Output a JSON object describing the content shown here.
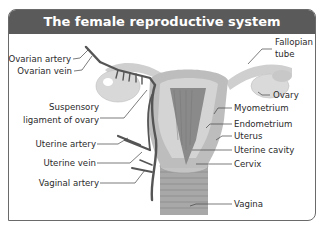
{
  "title": "The female reproductive system",
  "labels": {
    "left": {
      "ovarian_artery": "Ovarian artery",
      "ovarian_vein": "Ovarian vein",
      "suspensory_1": "Suspensory",
      "suspensory_2": "ligament of ovary",
      "uterine_artery": "Uterine artery",
      "uterine_vein": "Uterine vein",
      "vaginal_artery": "Vaginal artery"
    },
    "right": {
      "fallopian_1": "Fallopian",
      "fallopian_2": "tube",
      "ovary": "Ovary",
      "myometrium": "Myometrium",
      "endometrium": "Endometrium",
      "uterus": "Uterus",
      "uterine_cavity": "Uterine cavity",
      "cervix": "Cervix",
      "vagina": "Vagina"
    }
  },
  "colors": {
    "title_bar": "#5a5a5a",
    "frame_border": "#6a6a6a",
    "organ_light": "#d4d4d4",
    "organ_mid": "#b0b0b0",
    "organ_dark": "#7a7a7a",
    "vessel": "#555555"
  }
}
